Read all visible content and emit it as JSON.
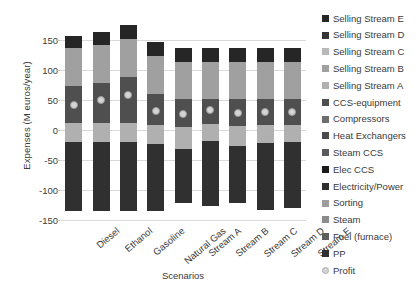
{
  "chart_data": {
    "type": "bar",
    "stacked": true,
    "title": "",
    "xlabel": "Scenarios",
    "ylabel": "Expenses (M euros/year)",
    "ylim": [
      -150,
      175
    ],
    "yticks": [
      150,
      100,
      50,
      0,
      -50,
      -100,
      -150
    ],
    "grid": true,
    "legend_position": "right",
    "categories": [
      "Diesel",
      "Ethanol",
      "Gasoline",
      "Natural Gas",
      "Stream A",
      "Stream B",
      "Stream C",
      "Stream D",
      "Stream E"
    ],
    "series": [
      {
        "name": "PP",
        "color": "#3f3f3f",
        "values": [
          22,
          22,
          22,
          22,
          22,
          22,
          22,
          22,
          22
        ]
      },
      {
        "name": "Fuel (furnace)",
        "color": "#8c8c8c",
        "values": [
          6,
          6,
          6,
          6,
          4,
          4,
          4,
          4,
          4
        ]
      },
      {
        "name": "Steam",
        "color": "#8c8c8c",
        "values": [
          2,
          2,
          2,
          2,
          2,
          2,
          2,
          2,
          2
        ]
      },
      {
        "name": "Sorting",
        "color": "#9e9e9e",
        "values": [
          10,
          10,
          10,
          10,
          10,
          10,
          10,
          10,
          10
        ]
      },
      {
        "name": "Electricity/Power",
        "color": "#2e2e2e",
        "values": [
          12,
          12,
          12,
          12,
          12,
          12,
          12,
          12,
          12
        ]
      },
      {
        "name": "Elec CCS",
        "color": "#1f1f1f",
        "values": [
          0,
          0,
          0,
          0,
          0,
          0,
          0,
          0,
          0
        ]
      },
      {
        "name": "Steam CCS",
        "color": "#5a5a5a",
        "values": [
          0,
          0,
          0,
          0,
          0,
          0,
          0,
          0,
          0
        ]
      },
      {
        "name": "Heat Exchangers",
        "color": "#4a4a4a",
        "values": [
          0,
          0,
          0,
          0,
          0,
          0,
          0,
          0,
          0
        ]
      },
      {
        "name": "Compressors",
        "color": "#6e6e6e",
        "values": [
          0,
          0,
          0,
          0,
          0,
          0,
          0,
          0,
          0
        ]
      },
      {
        "name": "CCS-equipment",
        "color": "#5c5c5c",
        "values": [
          62,
          68,
          76,
          48,
          48,
          48,
          48,
          48,
          48
        ]
      },
      {
        "name": "Selling Stream A",
        "color": "#a8a8a8",
        "values": [
          22,
          22,
          22,
          22,
          22,
          22,
          22,
          22,
          22
        ]
      },
      {
        "name": "Selling Stream B",
        "color": "#9c9c9c",
        "values": [
          18,
          24,
          30,
          22,
          16,
          16,
          16,
          16,
          16
        ]
      },
      {
        "name": "Selling Stream C",
        "color": "#b8b8b8",
        "values": [
          0,
          0,
          0,
          0,
          0,
          0,
          0,
          0,
          0
        ]
      },
      {
        "name": "Selling Stream D",
        "color": "#353535",
        "values": [
          0,
          0,
          0,
          0,
          0,
          0,
          0,
          0,
          0
        ]
      },
      {
        "name": "Selling Stream E",
        "color": "#2a2a2a",
        "values": [
          20,
          21,
          22,
          20,
          17,
          17,
          17,
          17,
          17
        ]
      }
    ],
    "bars": [
      {
        "category": "Diesel",
        "top": 157,
        "bottom": -135,
        "segments": [
          {
            "name": "Selling Stream E",
            "from": 136,
            "to": 157,
            "color": "#262626"
          },
          {
            "name": "Selling Stream B",
            "from": 73,
            "to": 136,
            "color": "#a0a0a0"
          },
          {
            "name": "CCS-equipment",
            "from": 11,
            "to": 73,
            "color": "#4f4f4f"
          },
          {
            "name": "Selling Stream A",
            "from": -20,
            "to": 11,
            "color": "#b0b0b0"
          },
          {
            "name": "PP",
            "from": -135,
            "to": -20,
            "color": "#303030"
          }
        ],
        "profit": 42
      },
      {
        "category": "Ethanol",
        "top": 163,
        "bottom": -135,
        "segments": [
          {
            "name": "Selling Stream E",
            "from": 141,
            "to": 163,
            "color": "#262626"
          },
          {
            "name": "Selling Stream B",
            "from": 78,
            "to": 141,
            "color": "#a0a0a0"
          },
          {
            "name": "CCS-equipment",
            "from": 11,
            "to": 78,
            "color": "#4f4f4f"
          },
          {
            "name": "Selling Stream A",
            "from": -20,
            "to": 11,
            "color": "#b0b0b0"
          },
          {
            "name": "PP",
            "from": -135,
            "to": -20,
            "color": "#303030"
          }
        ],
        "profit": 50
      },
      {
        "category": "Gasoline",
        "top": 175,
        "bottom": -135,
        "segments": [
          {
            "name": "Selling Stream E",
            "from": 152,
            "to": 175,
            "color": "#262626"
          },
          {
            "name": "Selling Stream B",
            "from": 88,
            "to": 152,
            "color": "#a0a0a0"
          },
          {
            "name": "CCS-equipment",
            "from": 11,
            "to": 88,
            "color": "#4f4f4f"
          },
          {
            "name": "Selling Stream A",
            "from": -20,
            "to": 11,
            "color": "#b0b0b0"
          },
          {
            "name": "PP",
            "from": -135,
            "to": -20,
            "color": "#303030"
          }
        ],
        "profit": 58
      },
      {
        "category": "Natural Gas",
        "top": 146,
        "bottom": -135,
        "segments": [
          {
            "name": "Selling Stream E",
            "from": 124,
            "to": 146,
            "color": "#262626"
          },
          {
            "name": "Selling Stream B",
            "from": 60,
            "to": 124,
            "color": "#a0a0a0"
          },
          {
            "name": "CCS-equipment",
            "from": 8,
            "to": 60,
            "color": "#4f4f4f"
          },
          {
            "name": "Selling Stream A",
            "from": -24,
            "to": 8,
            "color": "#b0b0b0"
          },
          {
            "name": "PP",
            "from": -135,
            "to": -24,
            "color": "#303030"
          }
        ],
        "profit": 31
      },
      {
        "category": "Stream A",
        "top": 136,
        "bottom": -122,
        "segments": [
          {
            "name": "Selling Stream E",
            "from": 113,
            "to": 136,
            "color": "#262626"
          },
          {
            "name": "Selling Stream B",
            "from": 52,
            "to": 113,
            "color": "#a0a0a0"
          },
          {
            "name": "CCS-equipment",
            "from": 5,
            "to": 52,
            "color": "#4f4f4f"
          },
          {
            "name": "Selling Stream A",
            "from": -32,
            "to": 5,
            "color": "#b0b0b0"
          },
          {
            "name": "PP",
            "from": -122,
            "to": -32,
            "color": "#303030"
          }
        ],
        "profit": 27
      },
      {
        "category": "Stream B",
        "top": 136,
        "bottom": -126,
        "segments": [
          {
            "name": "Selling Stream E",
            "from": 113,
            "to": 136,
            "color": "#262626"
          },
          {
            "name": "Selling Stream B",
            "from": 52,
            "to": 113,
            "color": "#a0a0a0"
          },
          {
            "name": "CCS-equipment",
            "from": 10,
            "to": 52,
            "color": "#4f4f4f"
          },
          {
            "name": "Selling Stream A",
            "from": -18,
            "to": 10,
            "color": "#b0b0b0"
          },
          {
            "name": "PP",
            "from": -126,
            "to": -18,
            "color": "#303030"
          }
        ],
        "profit": 33
      },
      {
        "category": "Stream C",
        "top": 136,
        "bottom": -122,
        "segments": [
          {
            "name": "Selling Stream E",
            "from": 113,
            "to": 136,
            "color": "#262626"
          },
          {
            "name": "Selling Stream B",
            "from": 52,
            "to": 113,
            "color": "#a0a0a0"
          },
          {
            "name": "CCS-equipment",
            "from": 7,
            "to": 52,
            "color": "#4f4f4f"
          },
          {
            "name": "Selling Stream A",
            "from": -26,
            "to": 7,
            "color": "#b0b0b0"
          },
          {
            "name": "PP",
            "from": -122,
            "to": -26,
            "color": "#303030"
          }
        ],
        "profit": 29
      },
      {
        "category": "Stream D",
        "top": 136,
        "bottom": -133,
        "segments": [
          {
            "name": "Selling Stream E",
            "from": 113,
            "to": 136,
            "color": "#262626"
          },
          {
            "name": "Selling Stream B",
            "from": 52,
            "to": 113,
            "color": "#a0a0a0"
          },
          {
            "name": "CCS-equipment",
            "from": 8,
            "to": 52,
            "color": "#4f4f4f"
          },
          {
            "name": "Selling Stream A",
            "from": -22,
            "to": 8,
            "color": "#b0b0b0"
          },
          {
            "name": "PP",
            "from": -133,
            "to": -22,
            "color": "#303030"
          }
        ],
        "profit": 30
      },
      {
        "category": "Stream E",
        "top": 136,
        "bottom": -130,
        "segments": [
          {
            "name": "Selling Stream E",
            "from": 113,
            "to": 136,
            "color": "#262626"
          },
          {
            "name": "Selling Stream B",
            "from": 52,
            "to": 113,
            "color": "#a0a0a0"
          },
          {
            "name": "CCS-equipment",
            "from": 8,
            "to": 52,
            "color": "#4f4f4f"
          },
          {
            "name": "Selling Stream A",
            "from": -20,
            "to": 8,
            "color": "#b0b0b0"
          },
          {
            "name": "PP",
            "from": -130,
            "to": -20,
            "color": "#303030"
          }
        ],
        "profit": 30
      }
    ],
    "profit_marker": {
      "name": "Profit",
      "color": "#d4d4d4",
      "border": "#9a9a9a"
    }
  },
  "legend": {
    "items": [
      {
        "label": "Selling Stream E",
        "color": "#262626",
        "shape": "square"
      },
      {
        "label": "Selling Stream D",
        "color": "#353535",
        "shape": "square"
      },
      {
        "label": "Selling Stream C",
        "color": "#b8b8b8",
        "shape": "square"
      },
      {
        "label": "Selling Stream B",
        "color": "#a0a0a0",
        "shape": "square"
      },
      {
        "label": "Selling Stream A",
        "color": "#b0b0b0",
        "shape": "square"
      },
      {
        "label": "CCS-equipment",
        "color": "#4f4f4f",
        "shape": "square"
      },
      {
        "label": "Compressors",
        "color": "#6e6e6e",
        "shape": "square"
      },
      {
        "label": "Heat Exchangers",
        "color": "#4a4a4a",
        "shape": "square"
      },
      {
        "label": "Steam CCS",
        "color": "#5a5a5a",
        "shape": "square"
      },
      {
        "label": "Elec CCS",
        "color": "#1a1a1a",
        "shape": "square"
      },
      {
        "label": "Electricity/Power",
        "color": "#2e2e2e",
        "shape": "square"
      },
      {
        "label": "Sorting",
        "color": "#9e9e9e",
        "shape": "square"
      },
      {
        "label": "Steam",
        "color": "#8c8c8c",
        "shape": "square"
      },
      {
        "label": "Fuel (furnace)",
        "color": "#5e5e5e",
        "shape": "square"
      },
      {
        "label": "PP",
        "color": "#303030",
        "shape": "square"
      },
      {
        "label": "Profit",
        "color": "#d4d4d4",
        "shape": "dot"
      }
    ]
  }
}
